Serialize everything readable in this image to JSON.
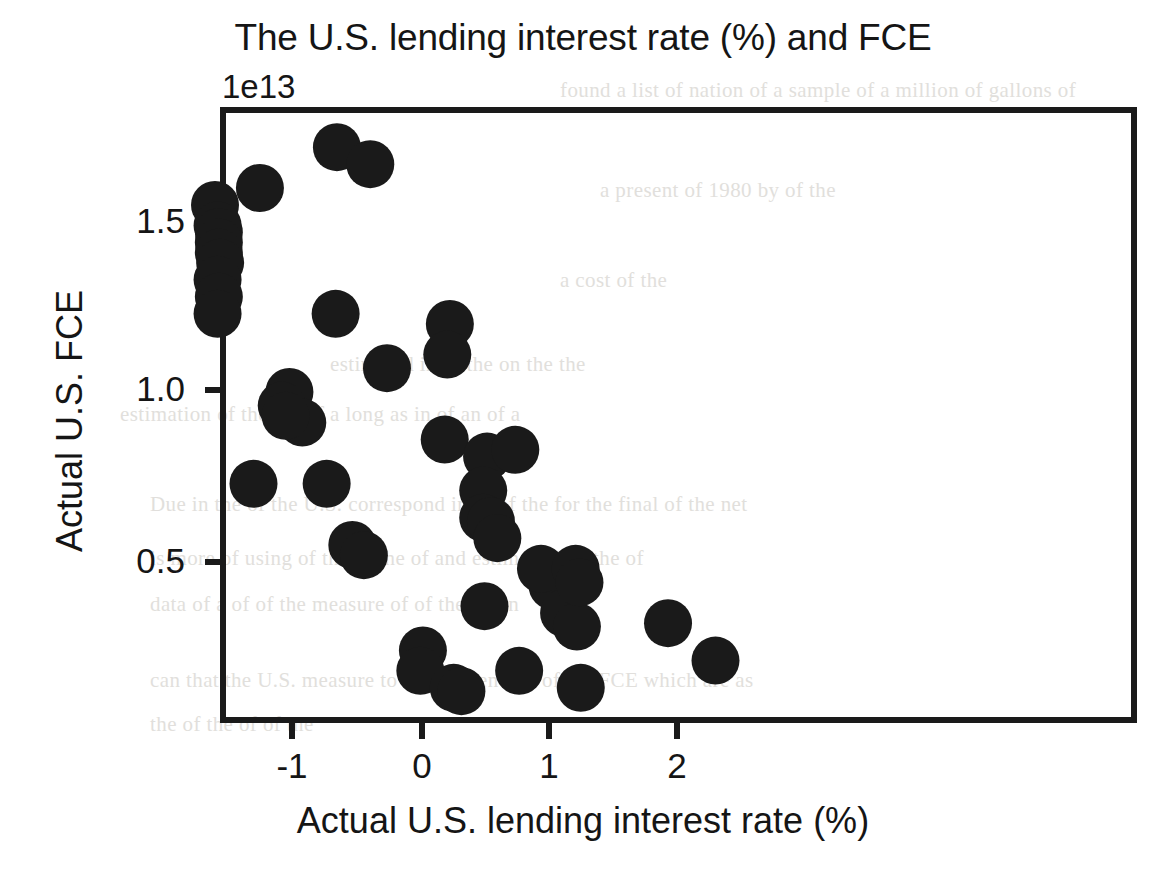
{
  "figure": {
    "title": "The U.S. lending interest rate (%) and FCE",
    "offset_label": "1e13",
    "xlabel": "Actual U.S. lending interest rate (%)",
    "ylabel": "Actual U.S. FCE",
    "marker_color": "#1a1a1a",
    "axis_color": "#1a1a1a",
    "background_color": "#ffffff"
  },
  "background_text": {
    "lines": [
      {
        "x": 560,
        "y": 78,
        "text": "found a list of nation of a sample of a million of gallons of"
      },
      {
        "x": 600,
        "y": 178,
        "text": "a present of 1980 by of the"
      },
      {
        "x": 560,
        "y": 268,
        "text": "a cost of the"
      },
      {
        "x": 330,
        "y": 352,
        "text": "estimated in   of the     on the the"
      },
      {
        "x": 120,
        "y": 402,
        "text": "estimation       of the        the   of a long as in      of an   of a"
      },
      {
        "x": 150,
        "y": 492,
        "text": "Due in the of the U.S. correspond in    of of the    for the final    of the net"
      },
      {
        "x": 150,
        "y": 546,
        "text": "is more of using of the of the     of     and estimation   of      the    of"
      },
      {
        "x": 150,
        "y": 592,
        "text": "data    of a    of    of   the   measure   of     of the   for  in"
      },
      {
        "x": 150,
        "y": 668,
        "text": "can  that  the U.S. measure to be independent   of the   FCE   which are as"
      },
      {
        "x": 150,
        "y": 712,
        "text": "the    of   the    of     of the"
      }
    ]
  },
  "axes": {
    "x_ticks": [
      {
        "value": -1,
        "label": "-1",
        "px": 292
      },
      {
        "value": 0,
        "label": "0",
        "px": 422
      },
      {
        "value": 1,
        "label": "1",
        "px": 549
      },
      {
        "value": 2,
        "label": "2",
        "px": 677
      }
    ],
    "y_ticks": [
      {
        "value": 1.5,
        "label": "1.5",
        "px": 222
      },
      {
        "value": 1.0,
        "label": "1.0",
        "px": 390
      },
      {
        "value": 0.5,
        "label": "0.5",
        "px": 562
      }
    ],
    "frame_px": {
      "left": 220,
      "top": 107,
      "right": 1137,
      "bottom": 723
    }
  },
  "chart_data": {
    "type": "scatter",
    "title": "The U.S. lending interest rate (%) and FCE",
    "xlabel": "Actual U.S. lending interest rate (%)",
    "ylabel": "Actual U.S. FCE",
    "y_offset_text": "1e13",
    "y_scale": 10000000000000.0,
    "grid": false,
    "legend": null,
    "marker": {
      "shape": "circle",
      "color": "#1a1a1a",
      "size_px": 48
    },
    "xlim": [
      -1.59,
      2.49
    ],
    "ylim": [
      0.02,
      1.82
    ],
    "xticks": [
      -1,
      0,
      1,
      2
    ],
    "yticks": [
      0.5,
      1.0,
      1.5
    ],
    "x": [
      -0.65,
      -0.39,
      -1.25,
      -1.6,
      -1.58,
      -1.57,
      -1.57,
      -1.57,
      -1.56,
      -1.58,
      -1.57,
      -1.58,
      -1.02,
      -1.08,
      -0.92,
      -1.05,
      -0.66,
      -1.3,
      -0.73,
      -0.26,
      0.23,
      0.21,
      -0.53,
      -0.44,
      0.19,
      0.52,
      0.49,
      0.49,
      0.55,
      0.74,
      1.03,
      0.94,
      0.5,
      0.6,
      1.21,
      1.12,
      0.02,
      0.0,
      0.26,
      0.32,
      0.77,
      1.22,
      1.24,
      1.25,
      1.93,
      2.3
    ],
    "y": [
      1.72,
      1.67,
      1.6,
      1.55,
      1.49,
      1.47,
      1.44,
      1.41,
      1.38,
      1.33,
      1.28,
      1.23,
      1.0,
      0.96,
      0.91,
      0.93,
      1.23,
      0.73,
      0.73,
      1.07,
      1.2,
      1.11,
      0.55,
      0.52,
      0.86,
      0.81,
      0.71,
      0.63,
      0.62,
      0.83,
      0.43,
      0.48,
      0.37,
      0.57,
      0.48,
      0.35,
      0.24,
      0.18,
      0.13,
      0.12,
      0.18,
      0.31,
      0.44,
      0.13,
      0.32,
      0.21
    ],
    "n_points": 46,
    "relationship": "negative / decreasing"
  }
}
